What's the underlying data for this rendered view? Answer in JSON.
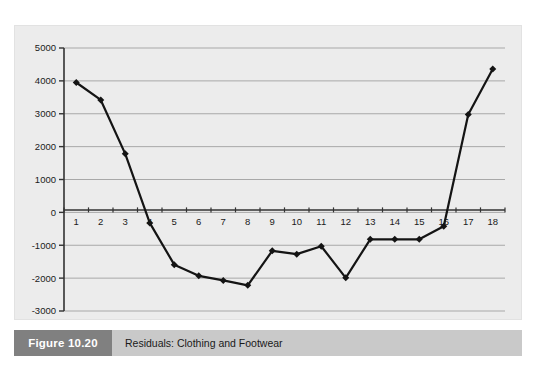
{
  "figure": {
    "number_label": "Figure 10.20",
    "caption": "Residuals: Clothing and Footwear",
    "number_box_color": "#808080",
    "caption_bar_color": "#c9c9c9"
  },
  "chart_data": {
    "type": "line",
    "title": "Residuals: Clothing and Footwear",
    "xlabel": "",
    "ylabel": "",
    "x": [
      1,
      2,
      3,
      4,
      5,
      6,
      7,
      8,
      9,
      10,
      11,
      12,
      13,
      14,
      15,
      16,
      17,
      18
    ],
    "categories": [
      "1",
      "2",
      "3",
      "4",
      "5",
      "6",
      "7",
      "8",
      "9",
      "10",
      "11",
      "12",
      "13",
      "14",
      "15",
      "16",
      "17",
      "18"
    ],
    "values": [
      3950,
      3420,
      1780,
      -320,
      -1590,
      -1930,
      -2070,
      -2220,
      -1170,
      -1270,
      -1030,
      -1990,
      -820,
      -820,
      -820,
      -420,
      2980,
      4360
    ],
    "series": [
      {
        "name": "Residuals",
        "values": [
          3950,
          3420,
          1780,
          -320,
          -1590,
          -1930,
          -2070,
          -2220,
          -1170,
          -1270,
          -1030,
          -1990,
          -820,
          -820,
          -820,
          -420,
          2980,
          4360
        ],
        "line_color": "#141414",
        "marker": "diamond"
      }
    ],
    "ylim": [
      -3000,
      5000
    ],
    "yticks": [
      5000,
      4000,
      3000,
      2000,
      1000,
      0,
      -1000,
      -2000,
      -3000
    ],
    "ytick_labels": [
      "5000",
      "4000",
      "3000",
      "2000",
      "1000",
      "0",
      "-1000",
      "-2000",
      "-3000"
    ],
    "xlim": [
      0.5,
      18.5
    ],
    "grid": true,
    "grid_axis": "y",
    "grid_color": "#a8a8a8",
    "legend": false,
    "legend_position": "none",
    "plot_background": "#ececec",
    "axis_color": "#333333"
  }
}
